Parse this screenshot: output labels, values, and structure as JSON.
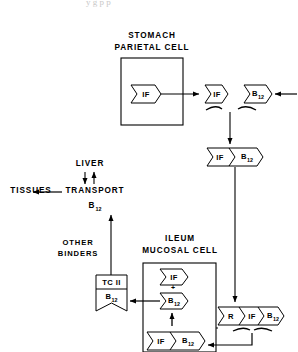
{
  "diagram": {
    "stroke_color": "#000000",
    "background_color": "#ffffff",
    "compartments": [
      {
        "id": "stomach",
        "label_line1": "STOMACH",
        "label_line2": "PARIETAL CELL"
      },
      {
        "id": "ileum",
        "label_line1": "ILEUM",
        "label_line2": "MUCOSAL CELL"
      }
    ],
    "labels": {
      "liver": "LIVER",
      "tissues": "TISSUES",
      "transport": "TRANSPORT",
      "transport_sub": "B",
      "transport_subscript": "12",
      "other_binders_line1": "OTHER",
      "other_binders_line2": "BINDERS"
    },
    "tokens": {
      "if": "IF",
      "b12_letter": "B",
      "b12_subscript": "12",
      "r": "R",
      "tc2": "TC II",
      "plus": "+"
    },
    "top_artifact": "y g              p        p"
  }
}
